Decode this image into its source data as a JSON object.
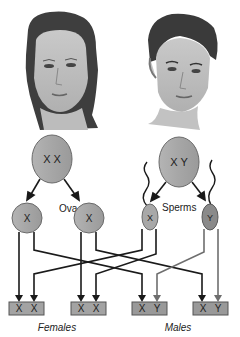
{
  "figures": {
    "female_face": "female-face-illustration",
    "male_face": "male-face-illustration"
  },
  "parents": {
    "female_cell": {
      "chromosomes": "X X",
      "color": "#a8a8a8"
    },
    "male_cell": {
      "chromosomes": "X Y",
      "color": "#a8a8a8"
    }
  },
  "gametes": {
    "ova_label": "Ova",
    "sperms_label": "Sperms",
    "ova": [
      {
        "chromosome": "X"
      },
      {
        "chromosome": "X"
      }
    ],
    "sperm": [
      {
        "chromosome": "X"
      },
      {
        "chromosome": "Y"
      }
    ]
  },
  "offspring": [
    {
      "genotype_a": "X",
      "genotype_b": "X"
    },
    {
      "genotype_a": "X",
      "genotype_b": "X"
    },
    {
      "genotype_a": "X",
      "genotype_b": "Y"
    },
    {
      "genotype_a": "X",
      "genotype_b": "Y"
    }
  ],
  "group_labels": {
    "females": "Females",
    "males": "Males"
  },
  "colors": {
    "cell_fill": "#a9a9a9",
    "cell_stroke": "#6a6a6a",
    "box_fill": "#9c9c9c",
    "arrow_dark": "#1a1a1a",
    "arrow_gray": "#6e6e6e",
    "y_sperm_fill": "#8a8a8a"
  }
}
